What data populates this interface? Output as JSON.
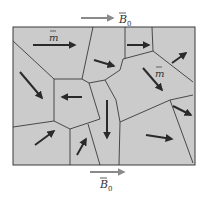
{
  "diagram": {
    "top_field_label": "B",
    "top_field_subscript": "0",
    "bottom_field_label": "B",
    "bottom_field_subscript": "0",
    "moment_label_1": "m",
    "moment_label_2": "m",
    "colors": {
      "domain_fill": "#cbcbcb",
      "boundary": "#3a3a3a",
      "arrow": "#2a2a2a",
      "field_arrow": "#8a8a8a"
    }
  }
}
